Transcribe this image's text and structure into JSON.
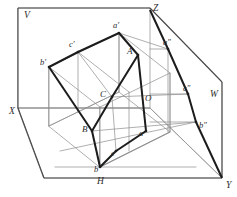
{
  "figure": {
    "kind": "descriptive-geometry-diagram",
    "background_color": "#ffffff",
    "ink_color": "#2b2b2b",
    "thin_line_color": "#8d8d8d",
    "thick_line_color": "#2b2b2b"
  },
  "axes": [
    {
      "id": "X",
      "label": "X",
      "x": 9,
      "y": 114
    },
    {
      "id": "Y",
      "label": "Y",
      "x": 226,
      "y": 188
    },
    {
      "id": "Z",
      "label": "Z",
      "x": 153,
      "y": 11
    },
    {
      "id": "V",
      "label": "V",
      "x": 24,
      "y": 18
    },
    {
      "id": "W",
      "label": "W",
      "x": 210,
      "y": 97
    },
    {
      "id": "H",
      "label": "H",
      "x": 97,
      "y": 184
    },
    {
      "id": "O",
      "label": "O",
      "x": 145,
      "y": 101
    }
  ],
  "space_vertices": [
    {
      "id": "A",
      "label": "A",
      "x": 127,
      "y": 54
    },
    {
      "id": "B",
      "label": "B",
      "x": 82,
      "y": 132
    },
    {
      "id": "C",
      "label": "C",
      "x": 100,
      "y": 97
    }
  ],
  "frontal_projection": {
    "plane": "V",
    "points": [
      {
        "id": "a-prime",
        "label": "a′",
        "x": 113,
        "y": 28
      },
      {
        "id": "b-prime",
        "label": "b′",
        "x": 40,
        "y": 65
      },
      {
        "id": "c-prime",
        "label": "c′",
        "x": 69,
        "y": 47
      }
    ]
  },
  "horizontal_projection": {
    "plane": "H",
    "points": [
      {
        "id": "a",
        "label": "a",
        "x": 139,
        "y": 136
      },
      {
        "id": "b",
        "label": "b",
        "x": 94,
        "y": 172
      },
      {
        "id": "c",
        "label": "c",
        "x": 111,
        "y": 156
      }
    ]
  },
  "profile_projection": {
    "plane": "W",
    "points": [
      {
        "id": "a-double-prime",
        "label": "a″",
        "x": 163,
        "y": 45
      },
      {
        "id": "b-double-prime",
        "label": "b″",
        "x": 199,
        "y": 128
      },
      {
        "id": "c-double-prime",
        "label": "c″",
        "x": 183,
        "y": 91
      }
    ]
  },
  "geometry": {
    "frame_outline": "18,8 150,8 150,10 222,178 44,178 18,108",
    "v_plane": "18,8 150,8 150,108 18,108",
    "w_plane": "150,10 222,82 222,178 150,108",
    "h_plane": "18,108 150,108 222,178 44,178",
    "triangle_space": "138,55 112,97 92,131",
    "triangle_frontal": "119,33 78,52 49,67",
    "triangle_horizontal": "146,131 116,151 100,167",
    "triangle_profile": "168,49 188,94 196,122"
  }
}
